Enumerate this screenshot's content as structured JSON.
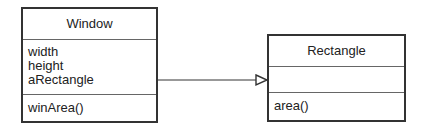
{
  "diagram": {
    "type": "uml-class",
    "classes": [
      {
        "name": "Window",
        "attributes": [
          "width",
          "height",
          "aRectangle"
        ],
        "operations": [
          "winArea()"
        ]
      },
      {
        "name": "Rectangle",
        "attributes": [],
        "operations": [
          "area()"
        ]
      }
    ],
    "relationship": {
      "from": "Window",
      "to": "Rectangle",
      "kind": "navigable-association",
      "arrowhead": "open-triangle"
    },
    "colors": {
      "border": "#333333",
      "divider": "#666666",
      "background": "#ffffff"
    }
  }
}
